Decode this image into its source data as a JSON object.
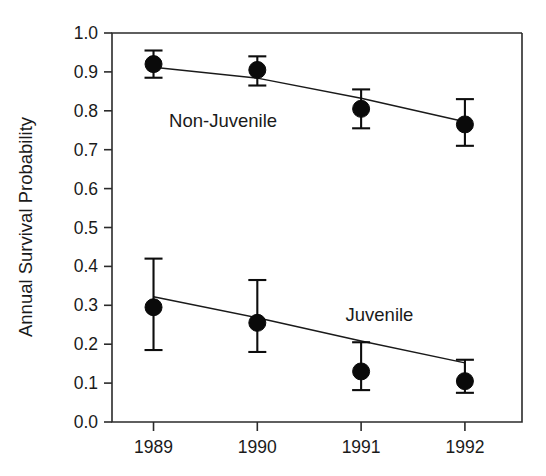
{
  "chart_data": {
    "type": "scatter",
    "title": "",
    "xlabel": "",
    "ylabel": "Annual Survival Probability",
    "x": [
      1989,
      1990,
      1991,
      1992
    ],
    "categories": [
      "1989",
      "1990",
      "1991",
      "1992"
    ],
    "xlim": [
      1988.6,
      1992.55
    ],
    "ylim": [
      0.0,
      1.0
    ],
    "grid": false,
    "legend_position": "inline-annotation",
    "xtick_labels": [
      "1989",
      "1990",
      "1991",
      "1992"
    ],
    "ytick_labels": [
      "0.0",
      "0.1",
      "0.2",
      "0.3",
      "0.4",
      "0.5",
      "0.6",
      "0.7",
      "0.8",
      "0.9",
      "1.0"
    ],
    "ytick_values": [
      0.0,
      0.1,
      0.2,
      0.3,
      0.4,
      0.5,
      0.6,
      0.7,
      0.8,
      0.9,
      1.0
    ],
    "series": [
      {
        "name": "Non-Juvenile",
        "values": [
          0.92,
          0.905,
          0.805,
          0.765
        ],
        "err_upper": [
          0.955,
          0.94,
          0.855,
          0.83
        ],
        "err_lower": [
          0.885,
          0.865,
          0.755,
          0.71
        ],
        "fit_line": [
          0.912,
          0.884,
          0.832,
          0.772
        ],
        "annotation": "Non-Juvenile",
        "annotation_x": 1989.15,
        "annotation_y": 0.775,
        "marker": "filled-circle",
        "color": "#0a0a0a"
      },
      {
        "name": "Juvenile",
        "values": [
          0.295,
          0.255,
          0.13,
          0.105
        ],
        "err_upper": [
          0.42,
          0.365,
          0.205,
          0.16
        ],
        "err_lower": [
          0.185,
          0.18,
          0.082,
          0.075
        ],
        "fit_line": [
          0.322,
          0.268,
          0.208,
          0.152
        ],
        "annotation": "Juvenile",
        "annotation_x": 1990.85,
        "annotation_y": 0.275,
        "marker": "filled-circle",
        "color": "#0a0a0a"
      }
    ]
  }
}
